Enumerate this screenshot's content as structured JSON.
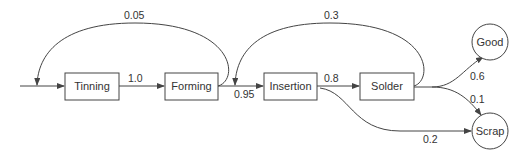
{
  "diagram": {
    "type": "process-flow",
    "nodes": [
      {
        "id": "tinning",
        "label": "Tinning",
        "shape": "rect"
      },
      {
        "id": "forming",
        "label": "Forming",
        "shape": "rect"
      },
      {
        "id": "insertion",
        "label": "Insertion",
        "shape": "rect"
      },
      {
        "id": "solder",
        "label": "Solder",
        "shape": "rect"
      },
      {
        "id": "good",
        "label": "Good",
        "shape": "circle"
      },
      {
        "id": "scrap",
        "label": "Scrap",
        "shape": "circle"
      }
    ],
    "edges": [
      {
        "from": "input",
        "to": "tinning",
        "label": ""
      },
      {
        "from": "tinning",
        "to": "forming",
        "label": "1.0"
      },
      {
        "from": "forming",
        "to": "tinning",
        "label": "0.05"
      },
      {
        "from": "forming",
        "to": "insertion",
        "label": "0.95"
      },
      {
        "from": "solder",
        "to": "insertion",
        "label": "0.3"
      },
      {
        "from": "insertion",
        "to": "solder",
        "label": "0.8"
      },
      {
        "from": "insertion",
        "to": "scrap",
        "label": "0.2"
      },
      {
        "from": "solder",
        "to": "good",
        "label": "0.6"
      },
      {
        "from": "solder",
        "to": "scrap",
        "label": "0.1"
      }
    ]
  },
  "labels": {
    "tinning": "Tinning",
    "forming": "Forming",
    "insertion": "Insertion",
    "solder": "Solder",
    "good": "Good",
    "scrap": "Scrap",
    "e_tin_form": "1.0",
    "e_form_tin": "0.05",
    "e_form_ins": "0.95",
    "e_sol_ins": "0.3",
    "e_ins_sol": "0.8",
    "e_ins_scrap": "0.2",
    "e_sol_good": "0.6",
    "e_sol_scrap": "0.1"
  }
}
